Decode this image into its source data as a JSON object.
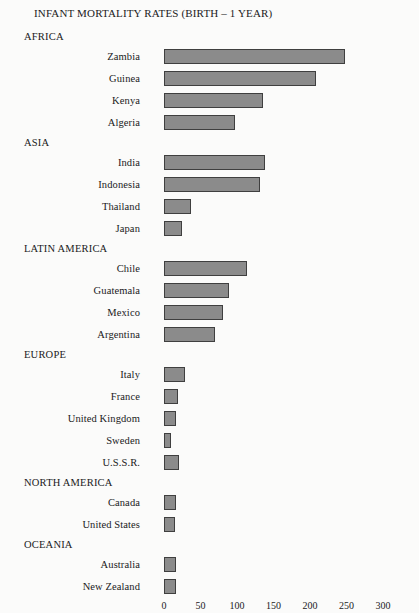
{
  "chart_data": {
    "type": "bar",
    "orientation": "horizontal",
    "title": "INFANT MORTALITY RATES (BIRTH – 1 YEAR)",
    "xlabel": "",
    "ylabel": "",
    "xlim": [
      0,
      300
    ],
    "xticks": [
      0,
      50,
      100,
      150,
      200,
      250,
      300
    ],
    "grid": false,
    "legend": false,
    "bar_color": "#8b8b8b",
    "bar_border_color": "#3f3f3f",
    "background_color": "#fbfbfa",
    "groups": [
      {
        "name": "AFRICA",
        "categories": [
          "Zambia",
          "Guinea",
          "Kenya",
          "Algeria"
        ],
        "values": [
          248,
          208,
          136,
          97
        ]
      },
      {
        "name": "ASIA",
        "categories": [
          "India",
          "Indonesia",
          "Thailand",
          "Japan"
        ],
        "values": [
          139,
          132,
          37,
          24
        ]
      },
      {
        "name": "LATIN AMERICA",
        "categories": [
          "Chile",
          "Guatemala",
          "Mexico",
          "Argentina"
        ],
        "values": [
          114,
          89,
          81,
          70
        ]
      },
      {
        "name": "EUROPE",
        "categories": [
          "Italy",
          "France",
          "United Kingdom",
          "Sweden",
          "U.S.S.R."
        ],
        "values": [
          29,
          19,
          17,
          10,
          20
        ]
      },
      {
        "name": "NORTH AMERICA",
        "categories": [
          "Canada",
          "United States"
        ],
        "values": [
          17,
          15
        ]
      },
      {
        "name": "OCEANIA",
        "categories": [
          "Australia",
          "New Zealand"
        ],
        "values": [
          17,
          16
        ]
      }
    ]
  }
}
